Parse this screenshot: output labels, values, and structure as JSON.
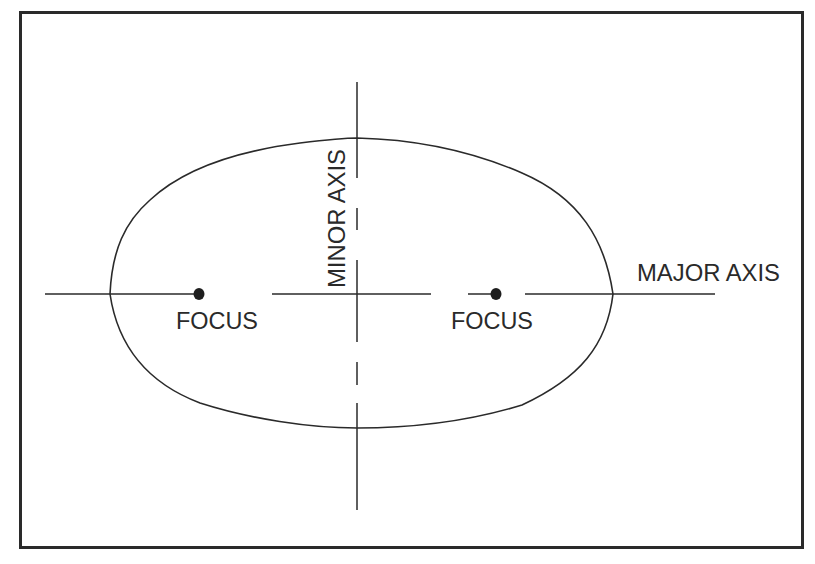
{
  "diagram": {
    "labels": {
      "major_axis": "MAJOR AXIS",
      "minor_axis": "MINOR AXIS",
      "focus_left": "FOCUS",
      "focus_right": "FOCUS"
    },
    "colors": {
      "ink": "#2a2a2a",
      "background": "#ffffff"
    },
    "shapes": {
      "frame": {
        "x1": 20,
        "y1": 12,
        "x2": 803,
        "y2": 548
      },
      "ellipse": {
        "left": [
          110,
          294
        ],
        "top": [
          357,
          138
        ],
        "right": [
          613,
          294
        ],
        "bottom": [
          357,
          428
        ]
      },
      "foci": [
        [
          199,
          294
        ],
        [
          496,
          294
        ]
      ],
      "major_axis_y": 294,
      "minor_axis_x": 357
    }
  }
}
